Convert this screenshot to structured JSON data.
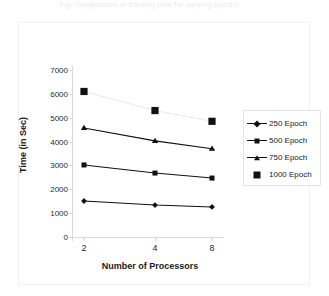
{
  "caption": {
    "text": "Fig. Comparison of training time for varying epochs"
  },
  "chart_data": {
    "type": "line",
    "title": "",
    "xlabel": "Number of Processors",
    "ylabel": "Time (in Sec)",
    "categories": [
      "2",
      "4",
      "8"
    ],
    "x_tick_labels": [
      "2",
      "4",
      "8"
    ],
    "y_tick_labels": [
      "0",
      "1000",
      "2000",
      "3000",
      "4000",
      "5000",
      "6000",
      "7000"
    ],
    "y_ticks": [
      0,
      1000,
      2000,
      3000,
      4000,
      5000,
      6000,
      7000
    ],
    "ylim": [
      0,
      7000
    ],
    "grid": false,
    "legend_position": "right",
    "series": [
      {
        "name": "250 Epoch",
        "marker": "diamond",
        "color": "#111111",
        "line": true,
        "values": [
          1510,
          1340,
          1260
        ]
      },
      {
        "name": "500 Epoch",
        "marker": "square",
        "color": "#111111",
        "line": true,
        "values": [
          3020,
          2680,
          2470
        ]
      },
      {
        "name": "750 Epoch",
        "marker": "triangle",
        "color": "#111111",
        "line": true,
        "values": [
          4570,
          4030,
          3700
        ]
      },
      {
        "name": "1000 Epoch",
        "marker": "big-square",
        "color": "#111111",
        "line": false,
        "line_color": "#e8e8ea",
        "values": [
          6100,
          5300,
          4850
        ]
      }
    ]
  },
  "legend": {
    "items": [
      {
        "label": "250 Epoch",
        "marker": "diamond",
        "has_line": true
      },
      {
        "label": "500 Epoch",
        "marker": "square",
        "has_line": true
      },
      {
        "label": "750 Epoch",
        "marker": "triangle",
        "has_line": true
      },
      {
        "label": "1000 Epoch",
        "marker": "big-square",
        "has_line": false
      }
    ]
  }
}
